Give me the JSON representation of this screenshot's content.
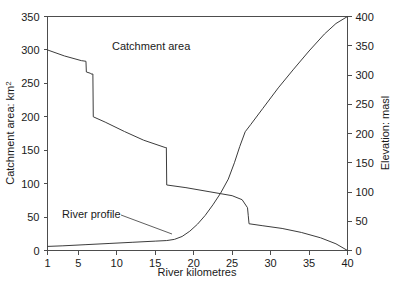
{
  "chart_data": {
    "type": "line",
    "title": "",
    "xlabel": "River kilometres",
    "ylabel": "Catchment area: km2",
    "y2label": "Elevation: masl",
    "xlim": [
      1,
      40
    ],
    "ylim": [
      0,
      350
    ],
    "y2lim": [
      0,
      400
    ],
    "grid": false,
    "legend_position": "inline-annotation",
    "xticks": [
      1,
      5,
      10,
      15,
      20,
      25,
      30,
      35,
      40
    ],
    "yticks": [
      0,
      50,
      100,
      150,
      200,
      250,
      300,
      350
    ],
    "y2ticks": [
      0,
      50,
      100,
      150,
      200,
      250,
      300,
      350,
      400
    ],
    "series": [
      {
        "name": "Catchment area",
        "axis": "left",
        "unit": "km2",
        "points": [
          [
            1,
            300
          ],
          [
            3.2,
            291
          ],
          [
            5.4,
            284
          ],
          [
            6.0,
            283
          ],
          [
            6.05,
            267
          ],
          [
            6.6,
            265
          ],
          [
            6.65,
            264
          ],
          [
            6.9,
            264
          ],
          [
            6.95,
            200
          ],
          [
            8.5,
            192
          ],
          [
            11.0,
            178
          ],
          [
            13.5,
            165
          ],
          [
            16.3,
            154
          ],
          [
            16.45,
            154
          ],
          [
            16.5,
            98
          ],
          [
            19.0,
            94
          ],
          [
            22.0,
            88
          ],
          [
            25.0,
            82
          ],
          [
            26.3,
            76
          ],
          [
            27.0,
            64
          ],
          [
            27.1,
            52
          ],
          [
            27.2,
            40
          ],
          [
            29.0,
            37
          ],
          [
            31.5,
            33
          ],
          [
            34.0,
            27
          ],
          [
            36.5,
            19
          ],
          [
            38.5,
            10
          ],
          [
            40,
            0
          ]
        ]
      },
      {
        "name": "River profile",
        "axis": "right",
        "unit": "masl",
        "points": [
          [
            1,
            7
          ],
          [
            3,
            8
          ],
          [
            6,
            10
          ],
          [
            9,
            12
          ],
          [
            12,
            14
          ],
          [
            15,
            16
          ],
          [
            16.5,
            17
          ],
          [
            17.5,
            19
          ],
          [
            18.5,
            24
          ],
          [
            19.5,
            33
          ],
          [
            20.5,
            45
          ],
          [
            21.5,
            60
          ],
          [
            22.5,
            78
          ],
          [
            23.5,
            98
          ],
          [
            24.5,
            122
          ],
          [
            25.3,
            150
          ],
          [
            26.0,
            178
          ],
          [
            26.7,
            203
          ],
          [
            27.4,
            215
          ],
          [
            29.0,
            243
          ],
          [
            31.0,
            278
          ],
          [
            33.0,
            310
          ],
          [
            35.0,
            341
          ],
          [
            37.0,
            370
          ],
          [
            38.5,
            388
          ],
          [
            40,
            400
          ]
        ]
      }
    ],
    "annotations": [
      {
        "name": "catchment-area-label",
        "text": "Catchment area",
        "x_px": 112,
        "y_px": 50
      },
      {
        "name": "river-profile-label",
        "text": "River profile",
        "x_px": 62,
        "y_px": 218
      }
    ]
  },
  "axes": {
    "x": {
      "title": "River kilometres",
      "ticks": [
        "1",
        "5",
        "10",
        "15",
        "20",
        "25",
        "30",
        "35",
        "40"
      ]
    },
    "y_left": {
      "title_main": "Catchment area: km",
      "title_sup": "2",
      "ticks": [
        "0",
        "50",
        "100",
        "150",
        "200",
        "250",
        "300",
        "350"
      ]
    },
    "y_right": {
      "title": "Elevation: masl",
      "ticks": [
        "0",
        "50",
        "100",
        "150",
        "200",
        "250",
        "300",
        "350",
        "400"
      ]
    }
  },
  "colors": {
    "line": "#3c3c3c",
    "axis": "#4d4d4d",
    "text": "#1a1a1a",
    "background": "#ffffff"
  }
}
